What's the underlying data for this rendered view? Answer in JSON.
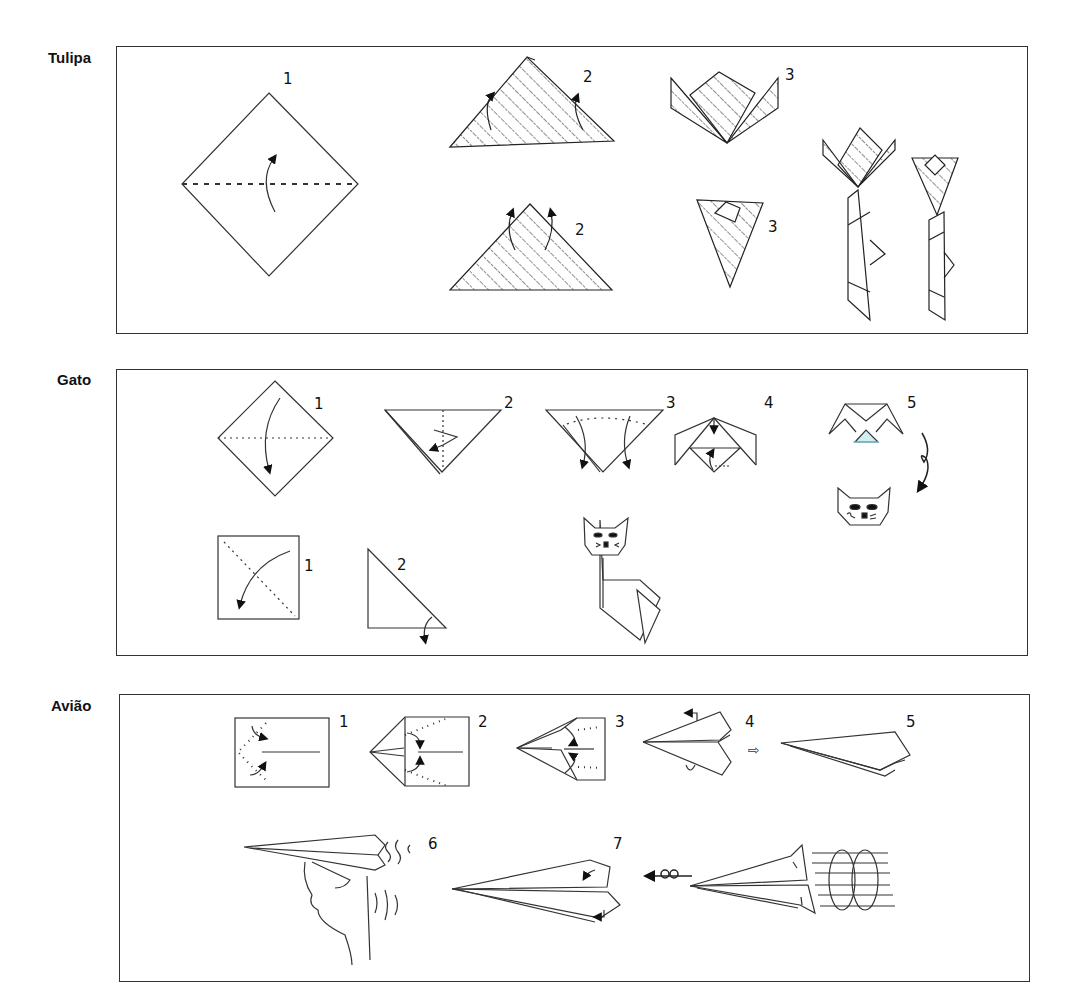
{
  "sections": [
    {
      "title": "Tulipa",
      "steps": [
        {
          "label": "1",
          "description": "square diamond folded in half along horizontal dashed line"
        },
        {
          "label": "2",
          "description": "triangle, fold corners up (front)"
        },
        {
          "label": "2",
          "description": "triangle, fold corners up (variant)"
        },
        {
          "label": "3",
          "description": "tulip flower open"
        },
        {
          "label": "3",
          "description": "tulip flower closed"
        }
      ],
      "final": "two finished tulips with stems and leaves"
    },
    {
      "title": "Gato",
      "head_steps": [
        {
          "label": "1",
          "description": "diamond fold down along horizontal line"
        },
        {
          "label": "2",
          "description": "triangle fold point down"
        },
        {
          "label": "3",
          "description": "fold ears down"
        },
        {
          "label": "4",
          "description": "fold top and bottom points"
        },
        {
          "label": "5",
          "description": "turn over, draw face"
        }
      ],
      "body_steps": [
        {
          "label": "1",
          "description": "square fold diagonally"
        },
        {
          "label": "2",
          "description": "triangle fold tip"
        }
      ],
      "final": "finished cat with head and body"
    },
    {
      "title": "Avião",
      "steps": [
        {
          "label": "1",
          "description": "rectangle fold corners to center"
        },
        {
          "label": "2",
          "description": "fold edges to center line"
        },
        {
          "label": "3",
          "description": "fold edges again"
        },
        {
          "label": "4",
          "description": "fold in half and fold wings"
        },
        {
          "label": "5",
          "description": "finished plane"
        },
        {
          "label": "6",
          "description": "throw the plane"
        },
        {
          "label": "7",
          "description": "adjust wing flaps for loops"
        }
      ],
      "transition_arrow": "⇨"
    }
  ]
}
